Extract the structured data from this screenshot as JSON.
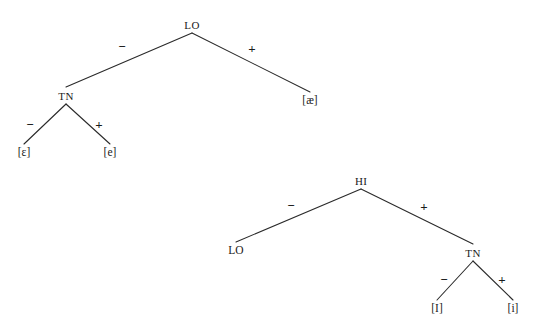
{
  "figure": {
    "title": "",
    "background_color": "#ffffff",
    "stroke_color": "#2a2a2a",
    "text_color": "#1a1a1a",
    "width": 538,
    "height": 333
  },
  "trees": [
    {
      "id": "tree-low",
      "root_label": "LO",
      "nodes": [
        {
          "name": "root",
          "label": "LO",
          "type": "internal",
          "x": 192,
          "y": 25
        },
        {
          "name": "internal-tn",
          "label": "TN",
          "type": "internal",
          "x": 66,
          "y": 96
        },
        {
          "name": "leaf-ae",
          "label": "[æ]",
          "type": "leaf",
          "x": 310,
          "y": 101
        },
        {
          "name": "leaf-epsilon",
          "label": "[ɛ]",
          "type": "leaf",
          "x": 24,
          "y": 153
        },
        {
          "name": "leaf-e",
          "label": "[e]",
          "type": "leaf",
          "x": 110,
          "y": 153
        }
      ],
      "edges": [
        {
          "name": "edge-root-tn",
          "from": "root",
          "to": "internal-tn",
          "sign": "−",
          "sign_x": 122,
          "sign_y": 46
        },
        {
          "name": "edge-root-ae",
          "from": "root",
          "to": "leaf-ae",
          "sign": "+",
          "sign_x": 252,
          "sign_y": 48
        },
        {
          "name": "edge-tn-epsilon",
          "from": "internal-tn",
          "to": "leaf-epsilon",
          "sign": "−",
          "sign_x": 30,
          "sign_y": 124
        },
        {
          "name": "edge-tn-e",
          "from": "internal-tn",
          "to": "leaf-e",
          "sign": "+",
          "sign_x": 99,
          "sign_y": 124
        }
      ]
    },
    {
      "id": "tree-high",
      "root_label": "HI",
      "nodes": [
        {
          "name": "root",
          "label": "HI",
          "type": "internal",
          "x": 361,
          "y": 181
        },
        {
          "name": "leaf-lo",
          "label": "LO",
          "type": "leaf",
          "x": 236,
          "y": 251
        },
        {
          "name": "internal-tn",
          "label": "TN",
          "type": "internal",
          "x": 473,
          "y": 253
        },
        {
          "name": "leaf-cap-i",
          "label": "[I]",
          "type": "leaf",
          "x": 437,
          "y": 309
        },
        {
          "name": "leaf-i",
          "label": "[i]",
          "type": "leaf",
          "x": 513,
          "y": 309
        }
      ],
      "edges": [
        {
          "name": "edge-root-lo",
          "from": "root",
          "to": "leaf-lo",
          "sign": "−",
          "sign_x": 291,
          "sign_y": 205
        },
        {
          "name": "edge-root-tn",
          "from": "root",
          "to": "internal-tn",
          "sign": "+",
          "sign_x": 424,
          "sign_y": 206
        },
        {
          "name": "edge-tn-cap-i",
          "from": "internal-tn",
          "to": "leaf-cap-i",
          "sign": "−",
          "sign_x": 444,
          "sign_y": 279
        },
        {
          "name": "edge-tn-i",
          "from": "internal-tn",
          "to": "leaf-i",
          "sign": "+",
          "sign_x": 502,
          "sign_y": 279
        }
      ]
    }
  ]
}
